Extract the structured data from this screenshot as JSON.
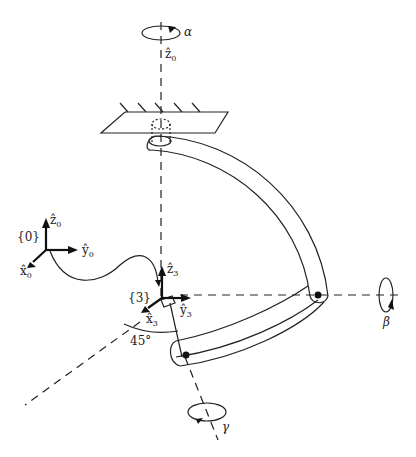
{
  "diagram": {
    "type": "wrist mechanism schematic",
    "labels": {
      "alpha": "α",
      "beta": "β",
      "gamma": "γ",
      "z0_axis": {
        "base": "ẑ",
        "sub": "0"
      },
      "frame0": "{0}",
      "frame0_z": {
        "base": "ẑ",
        "sub": "0"
      },
      "frame0_y": {
        "base": "ŷ",
        "sub": "0"
      },
      "frame0_x": {
        "base": "x̂",
        "sub": "0"
      },
      "frame3": "{3}",
      "frame3_z": {
        "base": "ẑ",
        "sub": "3"
      },
      "frame3_y": {
        "base": "ŷ",
        "sub": "3"
      },
      "frame3_x": {
        "base": "x̂",
        "sub": "3"
      },
      "angle": "45°"
    },
    "colors": {
      "stroke": "#222222",
      "background": "#ffffff"
    }
  }
}
